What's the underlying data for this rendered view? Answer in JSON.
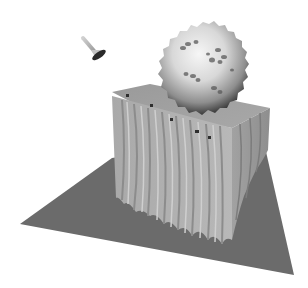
{
  "scene": {
    "description": "3D rendered grayscale scene: a spiky/bumpy sphere resting on top of a fluted, wavy-sided rectangular block which stands on a dark gray ground plane, with a small spotlight/lamp gizmo in the upper-left",
    "colors": {
      "background": "#ffffff",
      "ground_plane": "#6b6b6b",
      "block_light": "#bdbdbd",
      "block_mid": "#a6a6a6",
      "block_shadow": "#8a8a8a",
      "sphere_highlight": "#f2f2f2",
      "sphere_mid": "#c8c8c8",
      "sphere_dark": "#3c3c3c",
      "lamp_body": "#b0b0b0",
      "lamp_lens": "#2a2a2a"
    },
    "objects": [
      {
        "name": "ground-plane",
        "shape": "quad"
      },
      {
        "name": "fluted-block",
        "shape": "extruded-box"
      },
      {
        "name": "spiky-sphere",
        "shape": "bumpy-sphere"
      },
      {
        "name": "spotlight-gizmo",
        "shape": "lamp"
      }
    ]
  }
}
